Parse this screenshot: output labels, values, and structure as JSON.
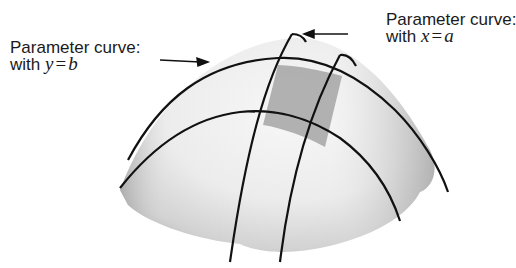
{
  "diagram": {
    "labels": {
      "left": {
        "line1": "Parameter curve:",
        "line2_prefix": "with ",
        "var": "y",
        "eq": "=",
        "val": "b"
      },
      "right": {
        "line1": "Parameter curve:",
        "line2_prefix": "with ",
        "var": "x",
        "eq": "=",
        "val": "a"
      }
    },
    "colors": {
      "surface_light": "#f2f2f2",
      "surface_mid": "#d4d4d4",
      "surface_dark": "#a8a8a8",
      "patch": "#9e9e9e",
      "curve": "#111111",
      "text": "#1a1a1a"
    }
  }
}
